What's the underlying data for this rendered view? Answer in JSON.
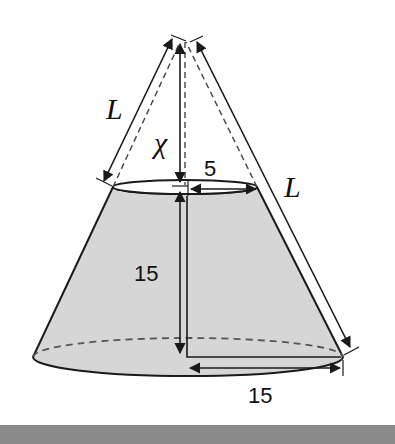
{
  "figure": {
    "labels": {
      "slant_left": "L",
      "slant_right": "L",
      "apex_height": "χ",
      "top_radius": "5",
      "frustum_height": "15",
      "bottom_radius": "15"
    }
  },
  "colors": {
    "fill": "#d6d6d6",
    "stroke": "#1a1a1a",
    "dashed": "#555555",
    "footer": "#8a8a8a",
    "background": "#ffffff"
  }
}
